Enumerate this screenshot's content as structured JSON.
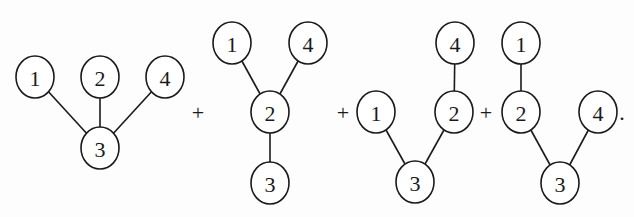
{
  "colors": {
    "ink": "#1a1a1a",
    "background": "#fdfdfd"
  },
  "node_radius": {
    "rx": 19,
    "ry": 21
  },
  "trees": [
    {
      "id": "tree-1",
      "nodes": [
        {
          "label": "1",
          "x": 35,
          "y": 77
        },
        {
          "label": "2",
          "x": 100,
          "y": 77
        },
        {
          "label": "4",
          "x": 165,
          "y": 77
        },
        {
          "label": "3",
          "x": 100,
          "y": 148
        }
      ],
      "edges": [
        [
          0,
          3
        ],
        [
          1,
          3
        ],
        [
          2,
          3
        ]
      ]
    },
    {
      "id": "tree-2",
      "nodes": [
        {
          "label": "1",
          "x": 232,
          "y": 43
        },
        {
          "label": "4",
          "x": 308,
          "y": 43
        },
        {
          "label": "2",
          "x": 270,
          "y": 112
        },
        {
          "label": "3",
          "x": 270,
          "y": 183
        }
      ],
      "edges": [
        [
          0,
          2
        ],
        [
          1,
          2
        ],
        [
          2,
          3
        ]
      ]
    },
    {
      "id": "tree-3",
      "nodes": [
        {
          "label": "4",
          "x": 455,
          "y": 43
        },
        {
          "label": "1",
          "x": 376,
          "y": 112
        },
        {
          "label": "2",
          "x": 454,
          "y": 112
        },
        {
          "label": "3",
          "x": 415,
          "y": 182
        }
      ],
      "edges": [
        [
          0,
          2
        ],
        [
          1,
          3
        ],
        [
          2,
          3
        ]
      ]
    },
    {
      "id": "tree-4",
      "nodes": [
        {
          "label": "1",
          "x": 521,
          "y": 43
        },
        {
          "label": "2",
          "x": 521,
          "y": 112
        },
        {
          "label": "4",
          "x": 598,
          "y": 112
        },
        {
          "label": "3",
          "x": 560,
          "y": 183
        }
      ],
      "edges": [
        [
          0,
          1
        ],
        [
          1,
          3
        ],
        [
          2,
          3
        ]
      ]
    }
  ],
  "operators": [
    {
      "symbol": "+",
      "x": 198,
      "y": 112
    },
    {
      "symbol": "+",
      "x": 343,
      "y": 112
    },
    {
      "symbol": "+",
      "x": 486,
      "y": 112
    },
    {
      "symbol": ".",
      "x": 622,
      "y": 112
    }
  ]
}
